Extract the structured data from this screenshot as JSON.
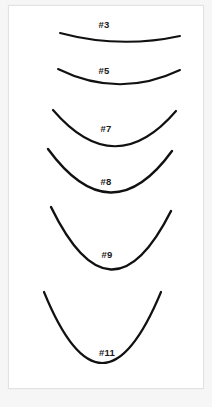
{
  "page": {
    "background_color": "#f6f6f6",
    "card_color": "#ffffff",
    "card_border_color": "#e2e2e2",
    "stroke_color": "#111111",
    "label_color": "#1a1a1a"
  },
  "chart_data": {
    "type": "line",
    "xlabel": "",
    "ylabel": "",
    "legend_position": "inline-centered",
    "grid": false,
    "categories": [
      "#3",
      "#5",
      "#7",
      "#8",
      "#9",
      "#11"
    ],
    "values": [
      10,
      18,
      40,
      48,
      70,
      83
    ],
    "series": [
      {
        "name": "arc_depth_px",
        "values": [
          10,
          18,
          40,
          48,
          70,
          83
        ]
      },
      {
        "name": "arc_width_px",
        "values": [
          120,
          122,
          124,
          124,
          120,
          117
        ]
      }
    ],
    "curves": [
      {
        "label": "#3",
        "size": 3,
        "start_x": 60,
        "start_y": 33,
        "end_x": 180,
        "end_y": 36,
        "ctrl_x": 120,
        "ctrl_y": 49,
        "stroke_width": 2.0,
        "label_x": 104,
        "label_y": 24,
        "depth_px": 10,
        "width_px": 120
      },
      {
        "label": "#5",
        "size": 5,
        "start_x": 58,
        "start_y": 69,
        "end_x": 180,
        "end_y": 70,
        "ctrl_x": 119,
        "ctrl_y": 99,
        "stroke_width": 2.0,
        "label_x": 104,
        "label_y": 70,
        "depth_px": 18,
        "width_px": 122
      },
      {
        "label": "#7",
        "size": 7,
        "start_x": 53,
        "start_y": 110,
        "end_x": 176,
        "end_y": 111,
        "ctrl_x": 115,
        "ctrl_y": 182,
        "stroke_width": 2.2,
        "label_x": 106,
        "label_y": 128,
        "depth_px": 40,
        "width_px": 123
      },
      {
        "label": "#8",
        "size": 8,
        "start_x": 48,
        "start_y": 149,
        "end_x": 172,
        "end_y": 151,
        "ctrl_x": 111,
        "ctrl_y": 235,
        "stroke_width": 2.4,
        "label_x": 106,
        "label_y": 181,
        "depth_px": 48,
        "width_px": 124
      },
      {
        "label": "#9",
        "size": 9,
        "start_x": 51,
        "start_y": 207,
        "end_x": 171,
        "end_y": 211,
        "ctrl_x": 111,
        "ctrl_y": 330,
        "stroke_width": 2.4,
        "label_x": 107,
        "label_y": 254,
        "depth_px": 70,
        "width_px": 120
      },
      {
        "label": "#11",
        "size": 11,
        "start_x": 44,
        "start_y": 292,
        "end_x": 161,
        "end_y": 292,
        "ctrl_x": 102,
        "ctrl_y": 434,
        "stroke_width": 2.2,
        "label_x": 107,
        "label_y": 352,
        "depth_px": 83,
        "width_px": 117
      }
    ]
  }
}
